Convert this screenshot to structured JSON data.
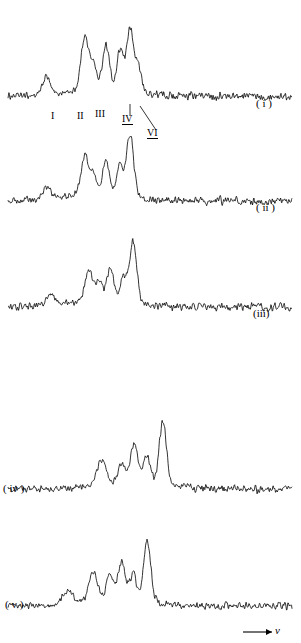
{
  "figure": {
    "title": "",
    "axis_label_x": "v",
    "trace_labels": [
      {
        "id": "i",
        "text": "( i )",
        "x": 256,
        "y": 104
      },
      {
        "id": "ii",
        "text": "( ii )",
        "x": 258,
        "y": 208
      },
      {
        "id": "iii",
        "text": "(iii)",
        "x": 254,
        "y": 314
      },
      {
        "id": "iv",
        "text": "( iv )",
        "x": 4,
        "y": 488
      },
      {
        "id": "v",
        "text": "( v )",
        "x": 6,
        "y": 604
      }
    ],
    "peak_labels": [
      {
        "id": "I",
        "text": "I",
        "x": 52,
        "y": 113,
        "underline": false
      },
      {
        "id": "II",
        "text": "II",
        "x": 79,
        "y": 113,
        "underline": false
      },
      {
        "id": "III",
        "text": "III",
        "x": 97,
        "y": 111,
        "underline": false
      },
      {
        "id": "IV",
        "text": "IV",
        "x": 124,
        "y": 116,
        "underline": true
      },
      {
        "id": "VI",
        "text": "VI",
        "x": 148,
        "y": 130,
        "underline": true
      }
    ],
    "leader_lines": [
      {
        "from_x": 130,
        "from_y": 116,
        "to_x": 130,
        "to_y": 104
      },
      {
        "from_x": 156,
        "from_y": 130,
        "to_x": 140,
        "to_y": 106
      }
    ],
    "axis_arrow": {
      "x1": 243,
      "y1": 632,
      "x2": 272,
      "y2": 632
    }
  },
  "chart_data": {
    "type": "line",
    "xlabel": "v",
    "ylabel": "",
    "grid": false,
    "legend": "none",
    "x_range": [
      0,
      1
    ],
    "noise_amplitude": 0.06,
    "series": [
      {
        "name": "i",
        "label": "( i )",
        "baseline_y": 96,
        "peaks": [
          {
            "center": 0.135,
            "height": 0.3,
            "width": 0.012,
            "label": "I"
          },
          {
            "center": 0.27,
            "height": 0.86,
            "width": 0.013,
            "label": "II"
          },
          {
            "center": 0.3,
            "height": 0.42,
            "width": 0.011,
            "label": ""
          },
          {
            "center": 0.345,
            "height": 0.72,
            "width": 0.012,
            "label": "III"
          },
          {
            "center": 0.395,
            "height": 0.62,
            "width": 0.011,
            "label": ""
          },
          {
            "center": 0.43,
            "height": 1.0,
            "width": 0.013,
            "label": "IV"
          },
          {
            "center": 0.46,
            "height": 0.4,
            "width": 0.01,
            "label": "VI"
          }
        ]
      },
      {
        "name": "ii",
        "label": "( ii )",
        "baseline_y": 201,
        "peaks": [
          {
            "center": 0.135,
            "height": 0.2,
            "width": 0.013
          },
          {
            "center": 0.27,
            "height": 0.62,
            "width": 0.013
          },
          {
            "center": 0.3,
            "height": 0.33,
            "width": 0.011
          },
          {
            "center": 0.345,
            "height": 0.55,
            "width": 0.012
          },
          {
            "center": 0.395,
            "height": 0.47,
            "width": 0.011
          },
          {
            "center": 0.43,
            "height": 1.0,
            "width": 0.013
          }
        ]
      },
      {
        "name": "iii",
        "label": "(iii)",
        "baseline_y": 307,
        "peaks": [
          {
            "center": 0.15,
            "height": 0.16,
            "width": 0.014
          },
          {
            "center": 0.285,
            "height": 0.5,
            "width": 0.013
          },
          {
            "center": 0.32,
            "height": 0.3,
            "width": 0.011
          },
          {
            "center": 0.36,
            "height": 0.52,
            "width": 0.012
          },
          {
            "center": 0.405,
            "height": 0.4,
            "width": 0.011
          },
          {
            "center": 0.44,
            "height": 1.0,
            "width": 0.013
          }
        ]
      },
      {
        "name": "iv",
        "label": "( iv )",
        "baseline_y": 489,
        "peaks": [
          {
            "center": 0.33,
            "height": 0.4,
            "width": 0.016
          },
          {
            "center": 0.4,
            "height": 0.3,
            "width": 0.013
          },
          {
            "center": 0.445,
            "height": 0.62,
            "width": 0.013
          },
          {
            "center": 0.49,
            "height": 0.42,
            "width": 0.012
          },
          {
            "center": 0.545,
            "height": 1.0,
            "width": 0.013
          }
        ]
      },
      {
        "name": "v",
        "label": "( v )",
        "baseline_y": 606,
        "peaks": [
          {
            "center": 0.21,
            "height": 0.22,
            "width": 0.016
          },
          {
            "center": 0.3,
            "height": 0.46,
            "width": 0.014
          },
          {
            "center": 0.36,
            "height": 0.4,
            "width": 0.013
          },
          {
            "center": 0.4,
            "height": 0.58,
            "width": 0.012
          },
          {
            "center": 0.44,
            "height": 0.44,
            "width": 0.012
          },
          {
            "center": 0.49,
            "height": 1.0,
            "width": 0.013
          }
        ]
      }
    ]
  }
}
